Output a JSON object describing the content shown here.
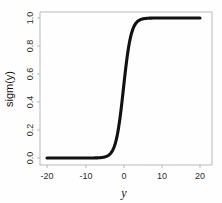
{
  "chart_data": {
    "type": "line",
    "title": "",
    "subtitle": "",
    "xlabel": "y",
    "ylabel": "sigm(y)",
    "xlim": [
      -20,
      20
    ],
    "ylim": [
      0.0,
      1.0
    ],
    "grid": false,
    "legend": null,
    "legend_position": "none",
    "line_color": "#111111",
    "frame_color": "#b9b9b9",
    "background_color": "#fefefe",
    "x_ticks": [
      -20,
      -10,
      0,
      10,
      20
    ],
    "x_tick_labels": [
      "-20",
      "-10",
      "0",
      "10",
      "20"
    ],
    "y_ticks": [
      0.0,
      0.2,
      0.4,
      0.6,
      0.8,
      1.0
    ],
    "y_tick_labels": [
      "0.0",
      "0.2",
      "0.4",
      "0.6",
      "0.8",
      "1.0"
    ],
    "series": [
      {
        "name": "sigm(y)",
        "function": "logistic",
        "x": [
          -20,
          -18,
          -16,
          -14,
          -12,
          -10,
          -9,
          -8,
          -7,
          -6,
          -5,
          -4.5,
          -4,
          -3.5,
          -3,
          -2.5,
          -2,
          -1.5,
          -1,
          -0.5,
          0,
          0.5,
          1,
          1.5,
          2,
          2.5,
          3,
          3.5,
          4,
          4.5,
          5,
          6,
          7,
          8,
          9,
          10,
          12,
          14,
          16,
          18,
          20
        ],
        "values": [
          0.0,
          0.0,
          0.0,
          0.0,
          0.0,
          0.0,
          0.0001,
          0.0003,
          0.0009,
          0.0025,
          0.0067,
          0.011,
          0.018,
          0.029,
          0.047,
          0.076,
          0.119,
          0.182,
          0.269,
          0.378,
          0.5,
          0.622,
          0.731,
          0.818,
          0.881,
          0.924,
          0.953,
          0.971,
          0.982,
          0.989,
          0.993,
          0.998,
          0.999,
          1.0,
          1.0,
          1.0,
          1.0,
          1.0,
          1.0,
          1.0,
          1.0
        ]
      }
    ]
  },
  "axes": {
    "x_title": "y",
    "y_title": "sigm(y)"
  }
}
